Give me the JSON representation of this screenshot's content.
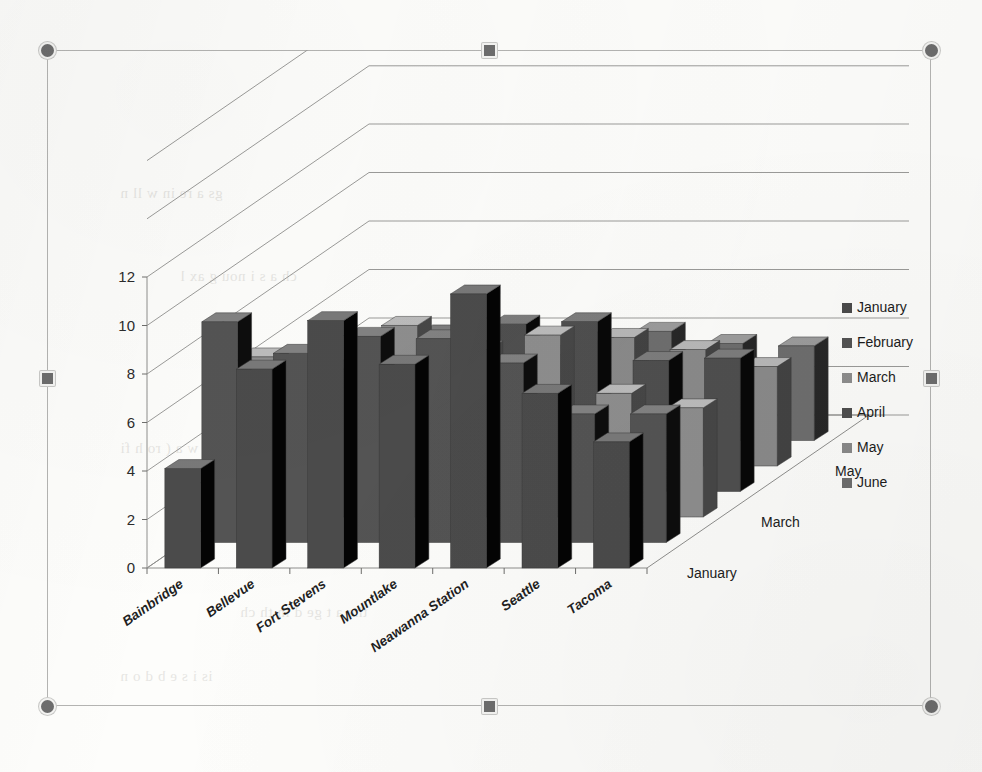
{
  "document": {
    "background_ghost_text": [
      "gs   a  re  in      w ll n   ",
      "ch  a   s  i   nou    g    ax  l",
      "he   t  e  co  n  s  in  e  k",
      "Ins   w    a   (   ro  h   fi",
      "t  ro  n   ts  be  ck   e",
      "the    a  t   ge  d  in  th  ch",
      "is   i   s  e   b    d o   n"
    ]
  },
  "selection": {
    "handles": [
      {
        "name": "handle-top-left",
        "type": "corner"
      },
      {
        "name": "handle-top-center",
        "type": "edge"
      },
      {
        "name": "handle-top-right",
        "type": "corner"
      },
      {
        "name": "handle-middle-left",
        "type": "edge"
      },
      {
        "name": "handle-middle-right",
        "type": "edge"
      },
      {
        "name": "handle-bottom-left",
        "type": "corner"
      },
      {
        "name": "handle-bottom-center",
        "type": "edge"
      },
      {
        "name": "handle-bottom-right",
        "type": "corner"
      }
    ]
  },
  "chart_data": {
    "type": "bar",
    "subtype": "3d-column",
    "title": "",
    "xlabel": "",
    "ylabel": "",
    "zlabel": "",
    "ylim": [
      0,
      12
    ],
    "yticks": [
      0,
      2,
      4,
      6,
      8,
      10,
      12
    ],
    "grid": true,
    "legend_position": "right",
    "categories": [
      "Bainbridge",
      "Bellevue",
      "Fort Stevens",
      "Mountlake",
      "Neawanna Station",
      "Seattle",
      "Tacoma"
    ],
    "depth_axis_ticks": [
      "January",
      "March",
      "May"
    ],
    "series": [
      {
        "name": "January",
        "color": "#4b4b4b",
        "values": [
          4.1,
          8.2,
          10.2,
          8.4,
          11.3,
          7.2,
          5.2
        ]
      },
      {
        "name": "February",
        "color": "#545454",
        "values": [
          9.1,
          7.8,
          8.5,
          8.4,
          7.4,
          5.3,
          5.3
        ]
      },
      {
        "name": "March",
        "color": "#8e8e8e",
        "values": [
          6.6,
          6.1,
          7.9,
          6.9,
          7.5,
          5.1,
          4.5
        ]
      },
      {
        "name": "April",
        "color": "#4f4f4f",
        "values": [
          4.4,
          6.2,
          6.5,
          6.9,
          7.0,
          5.4,
          5.5
        ]
      },
      {
        "name": "May",
        "color": "#8a8a8a",
        "values": [
          2.5,
          2.4,
          4.0,
          4.6,
          5.3,
          4.8,
          4.1
        ]
      },
      {
        "name": "June",
        "color": "#6e6e6e",
        "values": [
          2.5,
          2.4,
          3.9,
          4.1,
          4.5,
          4.0,
          3.9
        ]
      }
    ],
    "legend": [
      "January",
      "February",
      "March",
      "April",
      "May",
      "June"
    ]
  }
}
